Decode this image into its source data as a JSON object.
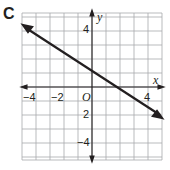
{
  "panel": {
    "letter": "C"
  },
  "chart_data": {
    "type": "line",
    "title": "",
    "xlabel": "x",
    "ylabel": "y",
    "origin_label": "O",
    "xlim": [
      -5,
      5
    ],
    "ylim": [
      -5,
      5.5
    ],
    "grid": true,
    "x_tick_labels": [
      "-4",
      "-2",
      "4"
    ],
    "y_tick_labels": [
      "4",
      "2",
      "-4"
    ],
    "series": [
      {
        "name": "line",
        "equation": "y = -0.5x + 1",
        "x": [
          -5,
          5
        ],
        "y": [
          3.5,
          -1.5
        ],
        "arrows": "both"
      }
    ],
    "colors": {
      "line": "#231f20",
      "grid": "#a7a9ac",
      "axes": "#231f20"
    }
  }
}
